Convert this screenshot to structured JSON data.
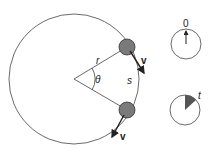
{
  "diagram": {
    "labels": {
      "radius": "r",
      "angle": "θ",
      "arc": "s",
      "velocity_upper": "v",
      "velocity_lower": "v",
      "clock_start": "0",
      "clock_end": "t"
    },
    "colors": {
      "stroke": "#333333",
      "ball_fill": "#777777",
      "wedge_fill": "#555555"
    }
  }
}
